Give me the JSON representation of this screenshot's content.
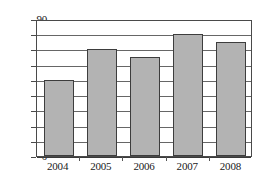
{
  "chart_data": {
    "type": "bar",
    "title": "",
    "subtitle": "",
    "xlabel": "",
    "ylabel": "",
    "categories": [
      "2004",
      "2005",
      "2006",
      "2007",
      "2008"
    ],
    "values": [
      50,
      70,
      65,
      80,
      75
    ],
    "series": [
      {
        "name": "",
        "values": [
          50,
          70,
          65,
          80,
          75
        ]
      }
    ],
    "ylim": [
      0,
      90
    ],
    "yticks": [
      0,
      10,
      20,
      30,
      40,
      50,
      60,
      70,
      80,
      90
    ],
    "ytick_labels": [
      "0",
      "10",
      "20",
      "30",
      "40",
      "50",
      "60",
      "70",
      "80",
      "90"
    ],
    "grid": true,
    "grid_axis": "y",
    "legend": false,
    "legend_position": "none",
    "bar_color": "#b3b3b3",
    "bar_edge_color": "#3d3d3d",
    "grid_color": "#666666",
    "frame_color": "#4a4a4a",
    "text_color": "#1a1a1a",
    "background": "#ffffff",
    "annotations": []
  }
}
